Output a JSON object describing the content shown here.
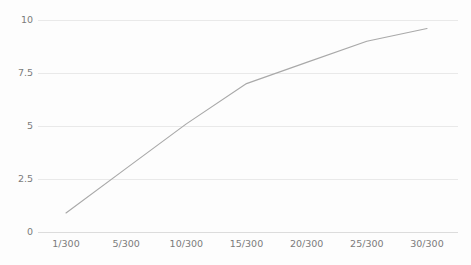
{
  "chart_data": {
    "type": "line",
    "title": "",
    "subtitle": "",
    "xlabel": "",
    "ylabel": "",
    "categories": [
      "1/300",
      "5/300",
      "10/300",
      "15/300",
      "20/300",
      "25/300",
      "30/300"
    ],
    "x": [
      1,
      5,
      10,
      15,
      20,
      25,
      30
    ],
    "series": [
      {
        "name": "series-1",
        "values": [
          0.9,
          3.0,
          5.1,
          7.0,
          8.0,
          9.0,
          9.6
        ],
        "color": "#a9a9a9"
      }
    ],
    "xtick_labels": [
      "1/300",
      "5/300",
      "10/300",
      "15/300",
      "20/300",
      "25/300",
      "30/300"
    ],
    "ytick_labels": [
      "0",
      "2.5",
      "5",
      "7.5",
      "10"
    ],
    "ytick_values": [
      0,
      2.5,
      5,
      7.5,
      10
    ],
    "ylim": [
      0,
      10
    ],
    "xlim": [
      1,
      30
    ],
    "grid": "horizontal",
    "legend": "none",
    "annotations": [],
    "background_color": "#fdfdfd",
    "gridline_color": "#e9e9e9",
    "axis_color": "#dcdcdc",
    "label_color": "#7b7b7b"
  }
}
